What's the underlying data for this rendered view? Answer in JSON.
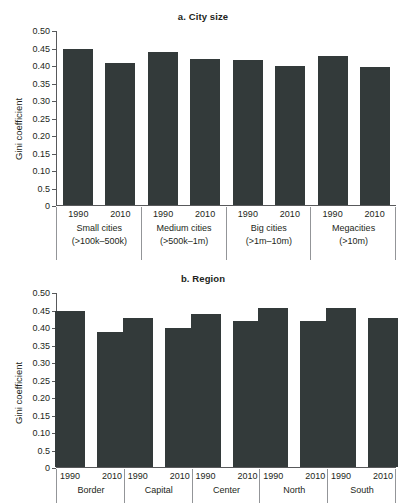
{
  "figure": {
    "ylabel": "Gini coefficient",
    "bar_color": "#333a3a",
    "axis_color": "#58595b"
  },
  "chart_data": [
    {
      "type": "bar",
      "title": "a. City size",
      "xlabel": "",
      "ylabel": "Gini coefficient",
      "ylim": [
        0,
        0.5
      ],
      "grid": false,
      "legend": "none",
      "ytick_labels": [
        "0.50",
        "0.45",
        "0.40",
        "0.35",
        "0.30",
        "0.25",
        "0.20",
        "0.15",
        "0.10",
        "0.5",
        "0"
      ],
      "ytick_values": [
        0.5,
        0.45,
        0.4,
        0.35,
        0.3,
        0.25,
        0.2,
        0.15,
        0.1,
        0.05,
        0
      ],
      "groups": [
        {
          "label_line1": "Small cities",
          "label_line2": "(>100k–500k)"
        },
        {
          "label_line1": "Medium cities",
          "label_line2": "(>500k–1m)"
        },
        {
          "label_line1": "Big cities",
          "label_line2": "(>1m–10m)"
        },
        {
          "label_line1": "Megacities",
          "label_line2": "(>10m)"
        }
      ],
      "categories": [
        "1990",
        "2010",
        "1990",
        "2010",
        "1990",
        "2010",
        "1990",
        "2010"
      ],
      "values": [
        0.449,
        0.409,
        0.439,
        0.419,
        0.418,
        0.399,
        0.428,
        0.398
      ]
    },
    {
      "type": "bar",
      "title": "b. Region",
      "xlabel": "",
      "ylabel": "Gini coefficient",
      "ylim": [
        0,
        0.5
      ],
      "grid": false,
      "legend": "none",
      "ytick_labels": [
        "0.50",
        "0.45",
        "0.40",
        "0.35",
        "0.30",
        "0.25",
        "0.20",
        "0.15",
        "0.10",
        "0.5",
        "0"
      ],
      "ytick_values": [
        0.5,
        0.45,
        0.4,
        0.35,
        0.3,
        0.25,
        0.2,
        0.15,
        0.1,
        0.05,
        0
      ],
      "groups": [
        {
          "label_line1": "Border",
          "label_line2": ""
        },
        {
          "label_line1": "Capital",
          "label_line2": ""
        },
        {
          "label_line1": "Center",
          "label_line2": ""
        },
        {
          "label_line1": "North",
          "label_line2": ""
        },
        {
          "label_line1": "South",
          "label_line2": ""
        }
      ],
      "categories": [
        "1990",
        "2010",
        "1990",
        "2010",
        "1990",
        "2010",
        "1990",
        "2010",
        "1990",
        "2010"
      ],
      "values": [
        0.449,
        0.389,
        0.429,
        0.399,
        0.439,
        0.419,
        0.458,
        0.419,
        0.457,
        0.428
      ]
    }
  ]
}
